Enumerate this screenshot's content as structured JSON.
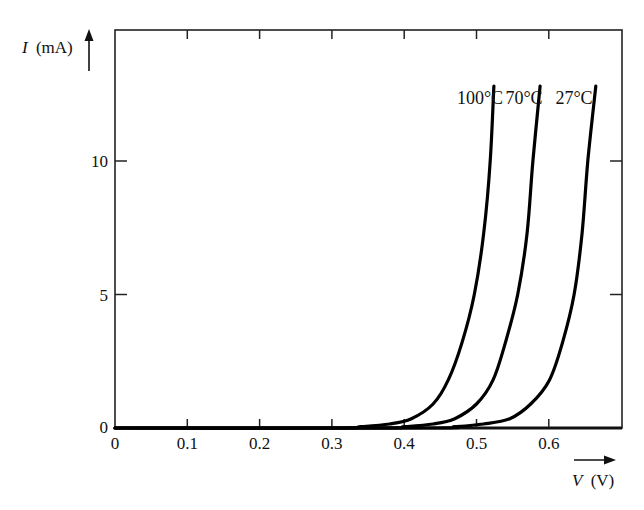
{
  "chart_data": {
    "type": "line",
    "title": "",
    "xlabel": "V (V)",
    "ylabel": "I (mA)",
    "xlabel_italic_part": "V",
    "xlabel_unit_part": "(V)",
    "ylabel_italic_part": "I",
    "ylabel_unit_part": "(mA)",
    "xlim": [
      0,
      0.7
    ],
    "ylim": [
      0,
      14.9
    ],
    "x_ticks": [
      0,
      0.1,
      0.2,
      0.3,
      0.4,
      0.5,
      0.6
    ],
    "x_tick_labels": [
      "0",
      "0.1",
      "0.2",
      "0.3",
      "0.4",
      "0.5",
      "0.6"
    ],
    "y_ticks": [
      0,
      5,
      10
    ],
    "y_tick_labels": [
      "0",
      "5",
      "10"
    ],
    "grid": false,
    "legend_position": "inline labels above curve tops",
    "series": [
      {
        "name": "100°C",
        "x": [
          0.0,
          0.3,
          0.34,
          0.38,
          0.41,
          0.44,
          0.461,
          0.48,
          0.497,
          0.51,
          0.519,
          0.524
        ],
        "y": [
          0.0,
          0.0,
          0.05,
          0.15,
          0.35,
          0.9,
          1.8,
          3.2,
          5.0,
          7.3,
          10.0,
          12.8
        ]
      },
      {
        "name": "70°C",
        "x": [
          0.0,
          0.36,
          0.4,
          0.44,
          0.47,
          0.5,
          0.523,
          0.54,
          0.557,
          0.57,
          0.578,
          0.588
        ],
        "y": [
          0.0,
          0.0,
          0.05,
          0.15,
          0.35,
          0.9,
          1.8,
          3.2,
          5.0,
          7.3,
          10.0,
          12.8
        ]
      },
      {
        "name": "27°C",
        "x": [
          0.0,
          0.43,
          0.47,
          0.51,
          0.546,
          0.575,
          0.601,
          0.619,
          0.635,
          0.646,
          0.654,
          0.665
        ],
        "y": [
          0.0,
          0.0,
          0.05,
          0.15,
          0.35,
          0.9,
          1.8,
          3.2,
          5.0,
          7.3,
          10.0,
          12.8
        ]
      }
    ]
  },
  "layout": {
    "plot_left": 115,
    "plot_right": 622,
    "plot_top": 30,
    "plot_bottom": 428,
    "px_per_volt": 723,
    "px_per_mA": 26.7
  },
  "labels": {
    "series_label_y": 104,
    "series_label_x": [
      480,
      524,
      574
    ]
  }
}
